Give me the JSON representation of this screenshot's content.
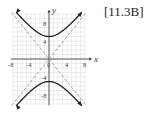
{
  "reference_label": "[11.3B]",
  "chart_data": {
    "type": "line",
    "title": "",
    "xlabel": "x",
    "ylabel": "y",
    "xlim": [
      -8,
      8
    ],
    "ylim": [
      -10,
      10
    ],
    "x_ticks": [
      -8,
      -4,
      0,
      4,
      8
    ],
    "x_tick_labels": [
      "-8",
      "-4",
      "0",
      "4",
      "8"
    ],
    "y_ticks": [
      -8,
      -4,
      4,
      8
    ],
    "y_tick_labels": [
      "-8",
      "-4",
      "4",
      "8"
    ],
    "grid": true,
    "grid_spacing": 1,
    "series": [
      {
        "name": "hyperbola upper branch",
        "equation": "y^2/25 - x^2/16 = 1",
        "vertex": [
          0,
          5
        ],
        "style": "solid",
        "arrows": true
      },
      {
        "name": "hyperbola lower branch",
        "equation": "y^2/25 - x^2/16 = 1",
        "vertex": [
          0,
          -5
        ],
        "style": "solid",
        "arrows": true
      },
      {
        "name": "asymptote",
        "equation": "y = 5x/4",
        "style": "dashed"
      },
      {
        "name": "asymptote",
        "equation": "y = -5x/4",
        "style": "dashed"
      }
    ],
    "colors": {
      "curve": "#222222",
      "asymptote": "#888888",
      "grid": "#d8d8d8",
      "axis": "#333333"
    }
  }
}
